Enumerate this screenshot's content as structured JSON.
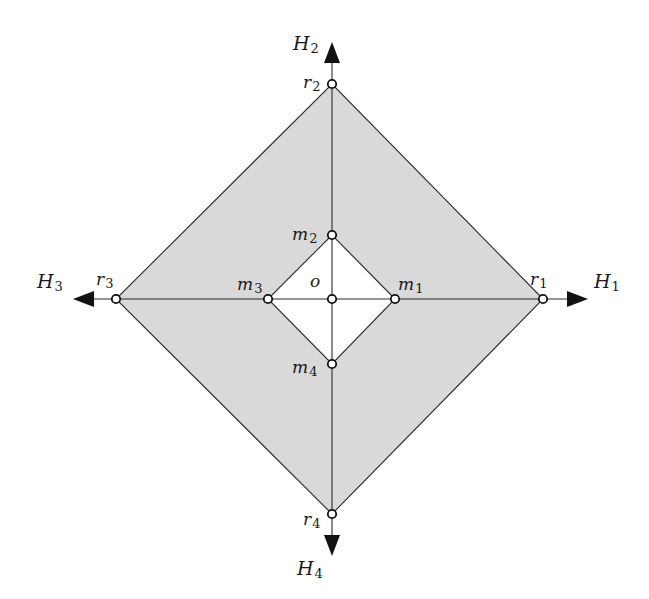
{
  "diagram": {
    "colors": {
      "outer_fill": "#d9d9d9",
      "inner_fill": "#ffffff",
      "stroke": "#2b2b2b",
      "background": "#ffffff"
    },
    "center": {
      "id": "o",
      "label": "o",
      "x": 332,
      "y": 299
    },
    "axes": [
      {
        "id": "H1",
        "label": "H",
        "sub": "1",
        "direction": "right",
        "tip": [
          588,
          299
        ]
      },
      {
        "id": "H2",
        "label": "H",
        "sub": "2",
        "direction": "up",
        "tip": [
          332,
          42
        ]
      },
      {
        "id": "H3",
        "label": "H",
        "sub": "3",
        "direction": "left",
        "tip": [
          73,
          299
        ]
      },
      {
        "id": "H4",
        "label": "H",
        "sub": "4",
        "direction": "down",
        "tip": [
          332,
          556
        ]
      }
    ],
    "outer_vertices": [
      {
        "id": "r1",
        "label": "r",
        "sub": "1",
        "x": 543,
        "y": 299
      },
      {
        "id": "r2",
        "label": "r",
        "sub": "2",
        "x": 332,
        "y": 84
      },
      {
        "id": "r3",
        "label": "r",
        "sub": "3",
        "x": 116,
        "y": 299
      },
      {
        "id": "r4",
        "label": "r",
        "sub": "4",
        "x": 332,
        "y": 514
      }
    ],
    "inner_vertices": [
      {
        "id": "m1",
        "label": "m",
        "sub": "1",
        "x": 395,
        "y": 299
      },
      {
        "id": "m2",
        "label": "m",
        "sub": "2",
        "x": 332,
        "y": 235
      },
      {
        "id": "m3",
        "label": "m",
        "sub": "3",
        "x": 268,
        "y": 299
      },
      {
        "id": "m4",
        "label": "m",
        "sub": "4",
        "x": 332,
        "y": 364
      }
    ],
    "labels": {
      "H1": {
        "main": "H",
        "sub": "1"
      },
      "H2": {
        "main": "H",
        "sub": "2"
      },
      "H3": {
        "main": "H",
        "sub": "3"
      },
      "H4": {
        "main": "H",
        "sub": "4"
      },
      "r1": {
        "main": "r",
        "sub": "1"
      },
      "r2": {
        "main": "r",
        "sub": "2"
      },
      "r3": {
        "main": "r",
        "sub": "3"
      },
      "r4": {
        "main": "r",
        "sub": "4"
      },
      "m1": {
        "main": "m",
        "sub": "1"
      },
      "m2": {
        "main": "m",
        "sub": "2"
      },
      "m3": {
        "main": "m",
        "sub": "3"
      },
      "m4": {
        "main": "m",
        "sub": "4"
      },
      "o": {
        "main": "o"
      }
    }
  }
}
